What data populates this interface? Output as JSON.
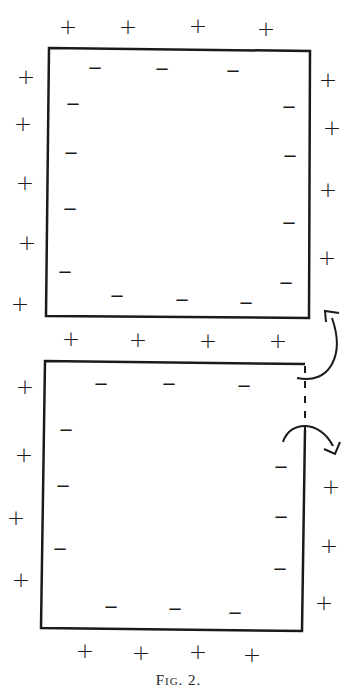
{
  "figure": {
    "caption": "Fig. 2.",
    "stroke_color": "#1a1a1a",
    "background": "#ffffff"
  },
  "top_square": {
    "outer_plus": {
      "top": [
        [
          68,
          27
        ],
        [
          128,
          27
        ],
        [
          198,
          26
        ],
        [
          266,
          29
        ]
      ],
      "left": [
        [
          26,
          77
        ],
        [
          23,
          124
        ],
        [
          25,
          183
        ],
        [
          27,
          243
        ],
        [
          20,
          304
        ]
      ],
      "right": [
        [
          328,
          80
        ],
        [
          332,
          128
        ],
        [
          328,
          190
        ],
        [
          327,
          258
        ]
      ],
      "bottom": [
        [
          71,
          339
        ],
        [
          138,
          340
        ],
        [
          208,
          341
        ],
        [
          278,
          341
        ]
      ]
    },
    "inner_minus": {
      "top": [
        [
          95,
          68
        ],
        [
          162,
          69
        ],
        [
          233,
          71
        ]
      ],
      "left": [
        [
          73,
          104
        ],
        [
          71,
          153
        ],
        [
          70,
          209
        ],
        [
          65,
          272
        ]
      ],
      "right": [
        [
          289,
          107
        ],
        [
          290,
          156
        ],
        [
          289,
          223
        ],
        [
          286,
          283
        ]
      ],
      "bottom": [
        [
          117,
          296
        ],
        [
          182,
          300
        ],
        [
          246,
          303
        ]
      ]
    }
  },
  "bottom_square": {
    "outer_plus": {
      "left": [
        [
          25,
          387
        ],
        [
          24,
          455
        ],
        [
          16,
          518
        ],
        [
          21,
          580
        ]
      ],
      "right": [
        [
          331,
          487
        ],
        [
          329,
          546
        ],
        [
          324,
          603
        ]
      ],
      "bottom": [
        [
          85,
          651
        ],
        [
          141,
          653
        ],
        [
          198,
          652
        ],
        [
          252,
          655
        ]
      ]
    },
    "inner_minus": {
      "top": [
        [
          101,
          384
        ],
        [
          169,
          384
        ],
        [
          244,
          386
        ]
      ],
      "left": [
        [
          66,
          430
        ],
        [
          63,
          486
        ],
        [
          60,
          549
        ]
      ],
      "right": [
        [
          281,
          467
        ],
        [
          281,
          517
        ],
        [
          280,
          569
        ]
      ],
      "bottom": [
        [
          111,
          607
        ],
        [
          175,
          609
        ],
        [
          235,
          613
        ]
      ]
    }
  },
  "arrows": [
    {
      "name": "curved-arrow-up",
      "description": "curved arrow from bottom square top-right corner up toward top square bottom-right corner"
    },
    {
      "name": "curved-arrow-down",
      "description": "curved arrow over dashed gap pointing down-right"
    }
  ],
  "signs": {
    "plus": "+",
    "minus": "−"
  }
}
